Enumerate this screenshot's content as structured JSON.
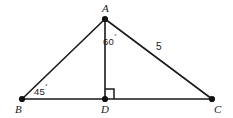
{
  "figure": {
    "type": "geometry-diagram",
    "shape": "triangle-with-altitude",
    "background_color": "#ffffff",
    "stroke_color": "#1a1a1a",
    "vertices": [
      {
        "name": "A",
        "label": "A",
        "x": 105,
        "y": 19,
        "label_x": 102,
        "label_y": 3
      },
      {
        "name": "B",
        "label": "B",
        "x": 22,
        "y": 99,
        "label_x": 15,
        "label_y": 104
      },
      {
        "name": "D",
        "label": "D",
        "x": 105,
        "y": 99,
        "label_x": 101,
        "label_y": 104
      },
      {
        "name": "C",
        "label": "C",
        "x": 212,
        "y": 99,
        "label_x": 214,
        "label_y": 104
      }
    ],
    "segments": [
      {
        "name": "segment-AB",
        "from": "A",
        "to": "B"
      },
      {
        "name": "segment-AC",
        "from": "A",
        "to": "C"
      },
      {
        "name": "segment-BC",
        "from": "B",
        "to": "C"
      },
      {
        "name": "segment-AD",
        "from": "A",
        "to": "D"
      }
    ],
    "angles": [
      {
        "name": "angle-DAC",
        "value": "60",
        "unit": "˚",
        "x": 103,
        "y": 36
      },
      {
        "name": "angle-ABD",
        "value": "45",
        "unit": "˚",
        "x": 34,
        "y": 86
      }
    ],
    "side_labels": [
      {
        "name": "side-AC-length",
        "value": "5",
        "x": 156,
        "y": 42
      }
    ],
    "right_angle": {
      "name": "right-angle-marker-at-D",
      "at": "D",
      "x": 105,
      "y": 89,
      "size": 9
    }
  }
}
